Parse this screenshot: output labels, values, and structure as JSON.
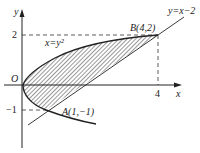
{
  "figure": {
    "type": "region-between-curves",
    "axes": {
      "x_label": "x",
      "y_label": "y",
      "origin_label": "O"
    },
    "ticks": {
      "y2": "2",
      "yneg1": "−1",
      "x4": "4"
    },
    "curves": [
      {
        "name": "parabola",
        "label": "x=y²",
        "equation": "x = y^2"
      },
      {
        "name": "line",
        "label": "y=x−2",
        "equation": "y = x - 2"
      }
    ],
    "points": [
      {
        "name": "A",
        "label": "A(1,−1)",
        "x": 1,
        "y": -1
      },
      {
        "name": "B",
        "label": "B(4,2)",
        "x": 4,
        "y": 2
      }
    ],
    "shaded_region": "between x=y^2 and y=x-2 for -1 <= y <= 2",
    "colors": {
      "ink": "#222222",
      "hatch": "#333333",
      "background": "#ffffff"
    }
  }
}
